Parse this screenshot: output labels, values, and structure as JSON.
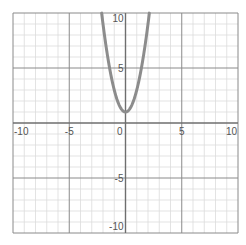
{
  "chart_data": {
    "type": "line",
    "title": "",
    "xlabel": "",
    "ylabel": "",
    "xlim": [
      -10,
      10
    ],
    "ylim": [
      -10,
      10
    ],
    "grid": true,
    "grid_step": 1,
    "major_step": 5,
    "x_tick_labels": [
      "-10",
      "-5",
      "0",
      "5",
      "10"
    ],
    "y_tick_labels": [
      "10",
      "5",
      "-5",
      "-10"
    ],
    "series": [
      {
        "name": "y = 2x^2 + 1",
        "color": "#8c8c8c",
        "x": [
          -2.12,
          -2,
          -1.5,
          -1,
          -0.5,
          0,
          0.5,
          1,
          1.5,
          2,
          2.12
        ],
        "y": [
          10,
          9,
          5.5,
          3,
          1.5,
          1,
          1.5,
          3,
          5.5,
          9,
          10
        ]
      }
    ]
  },
  "colors": {
    "minor_grid": "#dcdcdc",
    "major_grid": "#8a8a8a",
    "axis": "#6e6e6e",
    "curve": "#8c8c8c",
    "label": "#555555"
  }
}
